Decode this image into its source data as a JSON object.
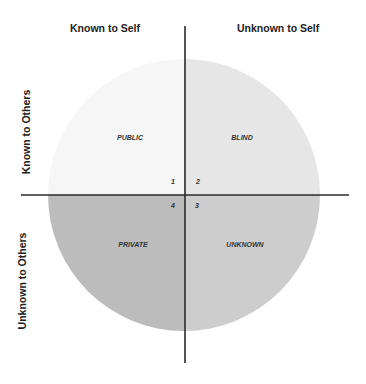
{
  "diagram": {
    "columns": [
      {
        "label": "Known to Self"
      },
      {
        "label": "Unknown to Self"
      }
    ],
    "rows": [
      {
        "label": "Known to Others"
      },
      {
        "label": "Unknown to Others"
      }
    ],
    "quadrants": [
      {
        "number": "1",
        "label": "PUBLIC",
        "color": "#f6f6f6"
      },
      {
        "number": "2",
        "label": "BLIND",
        "color": "#e6e6e6"
      },
      {
        "number": "3",
        "label": "UNKNOWN",
        "color": "#cdcdcd"
      },
      {
        "number": "4",
        "label": "PRIVATE",
        "color": "#bcbcbc"
      }
    ],
    "axis_color": "#2a2a2a"
  }
}
